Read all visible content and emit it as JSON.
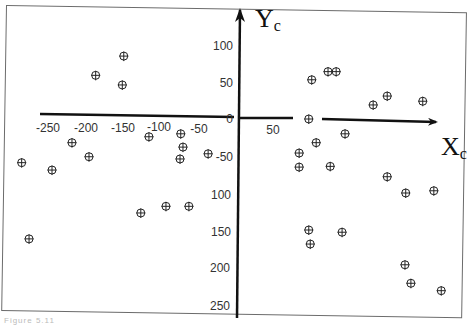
{
  "chart_data": {
    "type": "scatter",
    "title": "",
    "xlabel": "X_c",
    "ylabel": "Y_c",
    "x_tick_labels": [
      "-250",
      "-200",
      "-150",
      "-100",
      "-50",
      "0",
      "50"
    ],
    "y_tick_labels_above": [
      "100",
      "50",
      "0"
    ],
    "y_tick_labels_below": [
      "-50",
      "100",
      "150",
      "200",
      "250"
    ],
    "xlim": [
      -300,
      280
    ],
    "ylim": [
      -250,
      140
    ],
    "grid": false,
    "legend": null,
    "marker": "circle-crosshair",
    "series": [
      {
        "name": "points",
        "points": [
          {
            "x": -153,
            "y": 85
          },
          {
            "x": -191,
            "y": 59
          },
          {
            "x": -155,
            "y": 46
          },
          {
            "x": -119,
            "y": -24
          },
          {
            "x": -76,
            "y": -20
          },
          {
            "x": -73,
            "y": -38
          },
          {
            "x": -77,
            "y": -54
          },
          {
            "x": -39,
            "y": -47
          },
          {
            "x": -223,
            "y": -32
          },
          {
            "x": -200,
            "y": -51
          },
          {
            "x": -291,
            "y": -59
          },
          {
            "x": -250,
            "y": -69
          },
          {
            "x": -130,
            "y": -127
          },
          {
            "x": -96,
            "y": -118
          },
          {
            "x": -65,
            "y": -118
          },
          {
            "x": -281,
            "y": -162
          },
          {
            "x": 101,
            "y": 53
          },
          {
            "x": 123,
            "y": 64
          },
          {
            "x": 134,
            "y": 64
          },
          {
            "x": 184,
            "y": 19
          },
          {
            "x": 203,
            "y": 31
          },
          {
            "x": 251,
            "y": 24
          },
          {
            "x": 97,
            "y": 0
          },
          {
            "x": 146,
            "y": -20
          },
          {
            "x": 107,
            "y": -32
          },
          {
            "x": 84,
            "y": -46
          },
          {
            "x": 84,
            "y": -65
          },
          {
            "x": 126,
            "y": -64
          },
          {
            "x": 203,
            "y": -78
          },
          {
            "x": 228,
            "y": -100
          },
          {
            "x": 266,
            "y": -97
          },
          {
            "x": 97,
            "y": -150
          },
          {
            "x": 142,
            "y": -153
          },
          {
            "x": 99,
            "y": -169
          },
          {
            "x": 227,
            "y": -197
          },
          {
            "x": 235,
            "y": -222
          },
          {
            "x": 276,
            "y": -232
          }
        ]
      }
    ]
  },
  "axes": {
    "x_label_main": "X",
    "x_label_sub": "c",
    "y_label_main": "Y",
    "y_label_sub": "c"
  },
  "caption": "Figure 5.11"
}
